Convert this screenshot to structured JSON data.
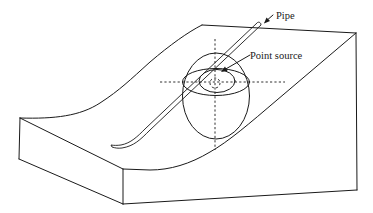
{
  "figure": {
    "type": "block diagram of a hillslope with buried pipe and point source",
    "labels": {
      "pipe": "Pipe",
      "point_source": "Point source"
    },
    "elements": [
      "slope-block",
      "pipe",
      "point-source",
      "outer-ellipsoid",
      "horizontal-ellipse",
      "inner-ellipse",
      "axis-dashed-lines"
    ],
    "colors": {
      "stroke": "#1a1a1a",
      "background": "#ffffff"
    }
  }
}
